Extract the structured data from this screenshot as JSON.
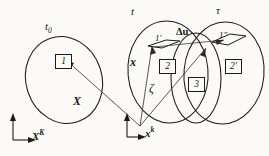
{
  "figure": {
    "background_color": "#fbfaf7",
    "stroke_color": "#1a1a1a",
    "width": 269,
    "height": 156
  },
  "configurations": {
    "reference": {
      "label": "t",
      "sub": "0",
      "name": "reference-configuration"
    },
    "current_t": {
      "label": "t",
      "name": "current-configuration-t"
    },
    "current_tau": {
      "label": "τ",
      "name": "current-configuration-tau"
    },
    "intersection": {
      "label": "ζ",
      "name": "intersection-region-zeta"
    }
  },
  "elements": {
    "box_1": "1",
    "box_2": "2",
    "box_3": "3",
    "box_2_prime": "2'",
    "parallelogram_1_prime": "1'",
    "parallelogram_1_double_prime": "1\""
  },
  "vectors": {
    "big_X": "X",
    "small_x": "x",
    "delta_u": "Δu"
  },
  "axes": {
    "material": {
      "label": "X",
      "index": "K"
    },
    "spatial": {
      "label": "x",
      "index": "k"
    }
  }
}
